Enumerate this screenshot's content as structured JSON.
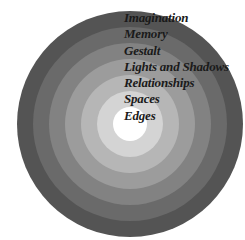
{
  "diagram": {
    "type": "concentric-circles",
    "rings": [
      {
        "label": "Imagination",
        "color": "#545454"
      },
      {
        "label": "Memory",
        "color": "#6a6a6a"
      },
      {
        "label": "Gestalt",
        "color": "#828282"
      },
      {
        "label": "Lights and Shadows",
        "color": "#9c9c9c"
      },
      {
        "label": "Relationships",
        "color": "#b6b6b6"
      },
      {
        "label": "Spaces",
        "color": "#d4d4d4"
      },
      {
        "label": "Edges",
        "color": "#ffffff"
      }
    ]
  }
}
